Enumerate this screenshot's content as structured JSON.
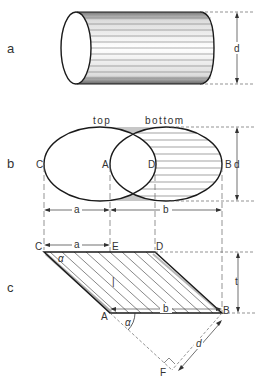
{
  "figure": {
    "parts": [
      {
        "id": "a",
        "label": "a",
        "description": "Cylinder with diameter d"
      },
      {
        "id": "b",
        "label": "b",
        "description": "Projection of inclined cylinder: top and bottom ellipses"
      },
      {
        "id": "c",
        "label": "c",
        "description": "Parallelogram side projection with angle alpha"
      }
    ],
    "part_a": {
      "dimension_label": "d"
    },
    "part_b": {
      "top_label": "top",
      "bottom_label": "bottom",
      "points": {
        "C": "C",
        "A": "A",
        "D": "D",
        "B": "B"
      },
      "dimension_d": "d",
      "dimension_a": "a",
      "dimension_b": "b"
    },
    "part_c": {
      "points": {
        "C": "C",
        "E": "E",
        "D": "D",
        "A": "A",
        "B": "B",
        "F": "F"
      },
      "dimension_a": "a",
      "dimension_b": "b",
      "dimension_t": "t",
      "dimension_d": "d",
      "angle_label": "α",
      "angle_label_small": "α"
    },
    "colors": {
      "line": "#1a1a1a",
      "dashed": "#666666",
      "hatch": "#555555",
      "shade": "#888888",
      "background": "#ffffff"
    }
  }
}
